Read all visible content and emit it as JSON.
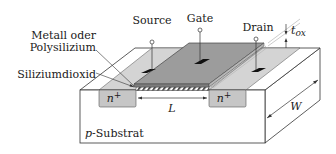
{
  "diagram": {
    "labels": {
      "source": "Source",
      "gate": "Gate",
      "drain": "Drain",
      "tox": "t",
      "tox_sub": "ox",
      "metal_line1": "Metall oder",
      "metal_line2": "Polysilizium",
      "oxide": "Siliziumdioxid",
      "n_left": "n",
      "n_right": "n",
      "n_sup": "+",
      "length": "L",
      "width": "W",
      "substrate_p": "p",
      "substrate_rest": "-Substrat"
    },
    "colors": {
      "gate_top": "#9a9a9a",
      "oxide_top": "#cfcfcf",
      "n_region": "#c8c8c8",
      "substrate": "#ffffff",
      "contact": "#111111",
      "line": "#333333"
    }
  }
}
